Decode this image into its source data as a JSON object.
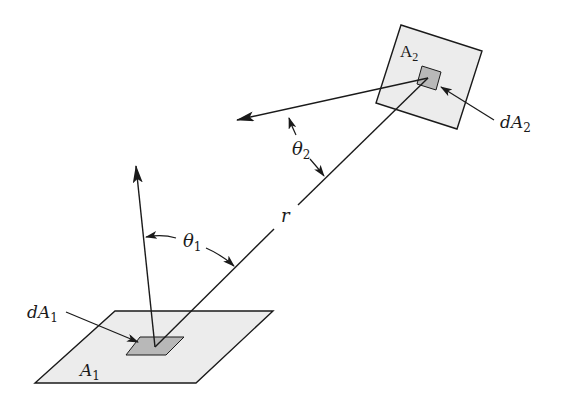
{
  "diagram": {
    "colors": {
      "stroke": "#1a1a1a",
      "surface_fill": "#ececec",
      "element_fill": "#b8b8b8",
      "background": "#ffffff"
    },
    "labels": {
      "surface_1": "A",
      "surface_1_sub": "1",
      "surface_2": "A",
      "surface_2_sub": "2",
      "element_1": "dA",
      "element_1_sub": "1",
      "element_2": "dA",
      "element_2_sub": "2",
      "angle_1": "θ",
      "angle_1_sub": "1",
      "angle_2": "θ",
      "angle_2_sub": "2",
      "distance": "r"
    }
  }
}
